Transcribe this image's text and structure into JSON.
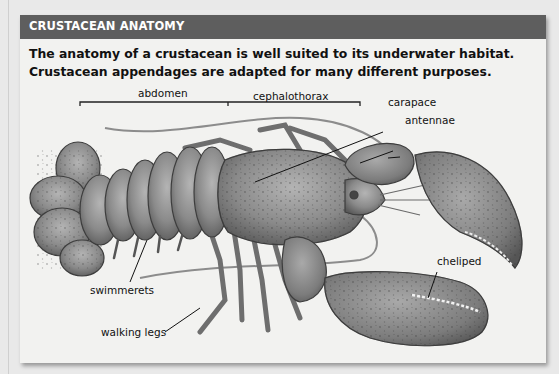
{
  "panel": {
    "title": "CRUSTACEAN ANATOMY",
    "intro_line_1": "The anatomy of a crustacean is well suited to its underwater habitat.",
    "intro_line_2": "Crustacean appendages are adapted for many different purposes.",
    "header_color": "#5e5e5e",
    "background_color": "#f2f2f0"
  },
  "diagram": {
    "labels": {
      "abdomen": "abdomen",
      "cephalothorax": "cephalothorax",
      "carapace": "carapace",
      "antennae": "antennae",
      "cheliped": "cheliped",
      "swimmerets": "swimmerets",
      "walking_legs": "walking legs"
    }
  }
}
